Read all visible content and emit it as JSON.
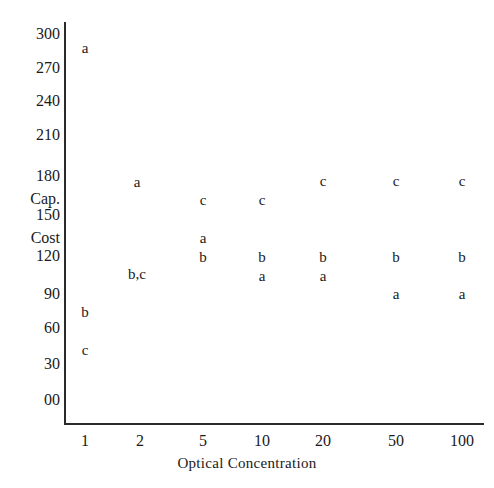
{
  "chart_data": {
    "type": "scatter",
    "title": "",
    "xlabel": "Optical Concentration",
    "ylabel": "Cap. Cost",
    "x_scale": "log-categorical",
    "categories": [
      1,
      2,
      5,
      10,
      20,
      50,
      100
    ],
    "xtick_labels": [
      "1",
      "2",
      "5",
      "10",
      "20",
      "50",
      "100"
    ],
    "ytick_labels": [
      "300",
      "270",
      "240",
      "210",
      "180",
      "Cap.",
      "150",
      "Cost",
      "120",
      "90",
      "60",
      "30",
      "00"
    ],
    "ylim": [
      0,
      300
    ],
    "y_major_ticks": [
      300,
      270,
      240,
      210,
      180,
      150,
      120,
      90,
      60,
      30,
      0
    ],
    "grid": false,
    "legend": null,
    "point_labels": [
      "a",
      "b",
      "c"
    ],
    "series": [
      {
        "name": "a",
        "label": "a",
        "x": [
          1,
          2,
          5,
          10,
          20,
          50,
          100
        ],
        "values": [
          293,
          180,
          135,
          108,
          108,
          93,
          93
        ]
      },
      {
        "name": "b",
        "label": "b",
        "x": [
          1,
          2,
          5,
          10,
          20,
          50,
          100
        ],
        "values": [
          72,
          110,
          120,
          120,
          120,
          120,
          120
        ]
      },
      {
        "name": "c",
        "label": "c",
        "x": [
          1,
          2,
          5,
          10,
          20,
          50,
          100
        ],
        "values": [
          52,
          110,
          165,
          165,
          177,
          180,
          180
        ]
      }
    ],
    "markers": [
      {
        "label": "a",
        "x": 85,
        "y": 48
      },
      {
        "label": "b",
        "x": 85,
        "y": 312
      },
      {
        "label": "c",
        "x": 85,
        "y": 350
      },
      {
        "label": "a",
        "x": 137,
        "y": 182
      },
      {
        "label": "b,c",
        "x": 137,
        "y": 274
      },
      {
        "label": "c",
        "x": 203,
        "y": 200
      },
      {
        "label": "a",
        "x": 203,
        "y": 238
      },
      {
        "label": "b",
        "x": 203,
        "y": 257
      },
      {
        "label": "c",
        "x": 262,
        "y": 200
      },
      {
        "label": "b",
        "x": 262,
        "y": 257
      },
      {
        "label": "a",
        "x": 262,
        "y": 276
      },
      {
        "label": "c",
        "x": 323,
        "y": 181
      },
      {
        "label": "b",
        "x": 323,
        "y": 257
      },
      {
        "label": "a",
        "x": 323,
        "y": 276
      },
      {
        "label": "c",
        "x": 396,
        "y": 181
      },
      {
        "label": "b",
        "x": 396,
        "y": 257
      },
      {
        "label": "a",
        "x": 396,
        "y": 294
      },
      {
        "label": "c",
        "x": 462,
        "y": 181
      },
      {
        "label": "b",
        "x": 462,
        "y": 257
      },
      {
        "label": "a",
        "x": 462,
        "y": 294
      }
    ],
    "ytick_positions": [
      {
        "text": "300",
        "y": 34
      },
      {
        "text": "270",
        "y": 68
      },
      {
        "text": "240",
        "y": 101
      },
      {
        "text": "210",
        "y": 135
      },
      {
        "text": "180",
        "y": 176
      },
      {
        "text": "Cap.",
        "y": 199
      },
      {
        "text": "150",
        "y": 215
      },
      {
        "text": "Cost",
        "y": 238
      },
      {
        "text": "120",
        "y": 256
      },
      {
        "text": "90",
        "y": 294
      },
      {
        "text": "60",
        "y": 328
      },
      {
        "text": "30",
        "y": 364
      },
      {
        "text": "00",
        "y": 400
      }
    ],
    "xtick_positions": [
      {
        "text": "1",
        "x": 85
      },
      {
        "text": "2",
        "x": 140
      },
      {
        "text": "5",
        "x": 203
      },
      {
        "text": "10",
        "x": 262
      },
      {
        "text": "20",
        "x": 323
      },
      {
        "text": "50",
        "x": 396
      },
      {
        "text": "100",
        "x": 462
      }
    ],
    "colors": {
      "axis": "#2b2b2b",
      "text": "#1a1a1a",
      "background": "#ffffff"
    }
  }
}
